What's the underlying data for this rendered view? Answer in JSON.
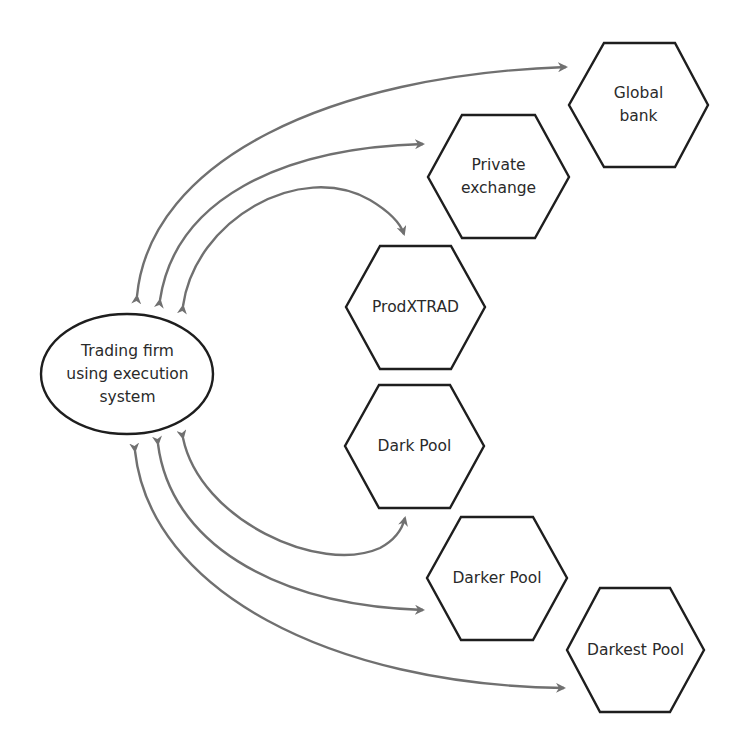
{
  "diagram": {
    "source_node": {
      "id": "trading-firm",
      "shape": "ellipse",
      "lines": [
        "Trading firm",
        "using execution",
        "system"
      ]
    },
    "venues": [
      {
        "id": "global-bank",
        "shape": "hexagon",
        "lines": [
          "Global",
          "bank"
        ]
      },
      {
        "id": "private-exchange",
        "shape": "hexagon",
        "lines": [
          "Private",
          "exchange"
        ]
      },
      {
        "id": "prodxtrad",
        "shape": "hexagon",
        "lines": [
          "ProdXTRAD"
        ]
      },
      {
        "id": "dark-pool",
        "shape": "hexagon",
        "lines": [
          "Dark Pool"
        ]
      },
      {
        "id": "darker-pool",
        "shape": "hexagon",
        "lines": [
          "Darker Pool"
        ]
      },
      {
        "id": "darkest-pool",
        "shape": "hexagon",
        "lines": [
          "Darkest Pool"
        ]
      }
    ],
    "connections": [
      {
        "from": "trading-firm",
        "to": "global-bank",
        "direction": "bidirectional"
      },
      {
        "from": "trading-firm",
        "to": "private-exchange",
        "direction": "bidirectional"
      },
      {
        "from": "trading-firm",
        "to": "prodxtrad",
        "direction": "bidirectional"
      },
      {
        "from": "trading-firm",
        "to": "dark-pool",
        "direction": "bidirectional"
      },
      {
        "from": "trading-firm",
        "to": "darker-pool",
        "direction": "bidirectional"
      },
      {
        "from": "trading-firm",
        "to": "darkest-pool",
        "direction": "bidirectional"
      }
    ],
    "colors": {
      "shape_stroke": "#1e1e1e",
      "arrow_stroke": "#707070",
      "text": "#2a2a2a",
      "background": "#ffffff"
    }
  }
}
